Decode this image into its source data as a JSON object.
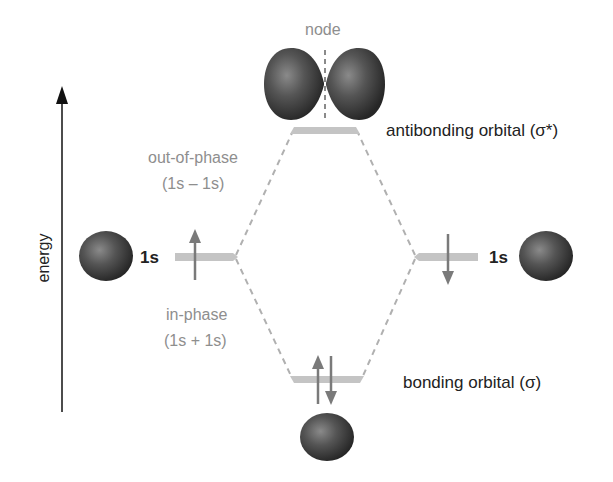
{
  "axis": {
    "label": "energy"
  },
  "labels": {
    "node": "node",
    "antibonding": "antibonding orbital (σ*)",
    "bonding": "bonding orbital (σ)",
    "out_of_phase": "out-of-phase",
    "out_of_phase_combo": "(1s – 1s)",
    "in_phase": "in-phase",
    "in_phase_combo": "(1s + 1s)",
    "left_atomic": "1s",
    "right_atomic": "1s"
  },
  "levels": [
    {
      "name": "antibonding",
      "electrons": 0
    },
    {
      "name": "left-1s",
      "electrons": 1,
      "spin": "up"
    },
    {
      "name": "right-1s",
      "electrons": 1,
      "spin": "down"
    },
    {
      "name": "bonding",
      "electrons": 2,
      "spin": "up-down"
    }
  ],
  "colors": {
    "orbital_bar": "#c4c4c4",
    "connector": "#b0b0b0",
    "electron_arrow": "#7a7a7a",
    "sphere": "#4a4a4a",
    "axis": "#111111",
    "label_gray": "#8e8e8e",
    "label_dark": "#222222"
  }
}
